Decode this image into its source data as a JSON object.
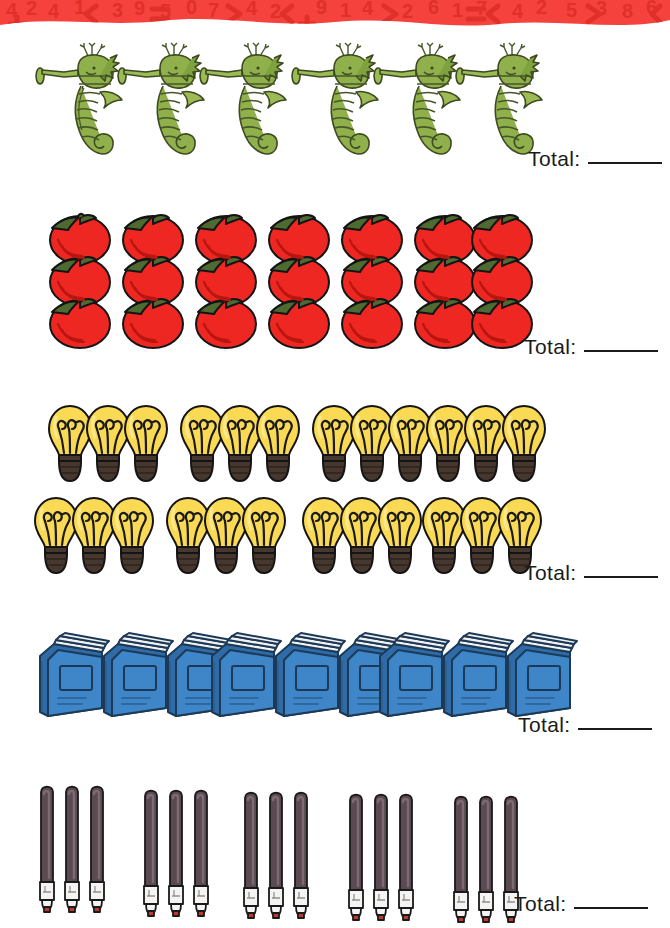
{
  "worksheet": {
    "banner": {
      "name": "decorative-number-border",
      "base_color": "#f5423c",
      "pattern_color": "#e8322c",
      "symbols": [
        "4",
        "2",
        "<",
        ">",
        "9",
        "+",
        "1",
        "7",
        "<",
        ">",
        "3",
        "6",
        "=",
        "7",
        "2",
        "4",
        "<",
        "5"
      ]
    },
    "total_label": "Total:",
    "rows": [
      {
        "id": "row-seahorses",
        "item": "seahorse",
        "item_label": "seahorse",
        "groups": 2,
        "per_group": 3,
        "count": 6,
        "arrangement": "1 line of 2 groups",
        "colors": {
          "body": "#8fb04a",
          "dark": "#47562a",
          "outline": "#3d4a22"
        },
        "total_value": ""
      },
      {
        "id": "row-tomatoes",
        "item": "tomato",
        "item_label": "tomato",
        "groups": 7,
        "per_group": 3,
        "count": 21,
        "arrangement": "7 vertical stacks of 3",
        "colors": {
          "body": "#ee2722",
          "dark": "#b8160f",
          "stem": "#4d6b31",
          "outline": "#1a1a1a"
        },
        "total_value": ""
      },
      {
        "id": "row-lightbulbs",
        "item": "lightbulb",
        "item_label": "light bulb",
        "groups": 8,
        "per_group": 3,
        "count": 24,
        "arrangement": "2 lines of 4 groups",
        "colors": {
          "glass": "#fada54",
          "glass_light": "#fde88a",
          "base": "#46372f",
          "outline": "#1a1a1a"
        },
        "total_value": ""
      },
      {
        "id": "row-books",
        "item": "book",
        "item_label": "book",
        "groups": 3,
        "per_group": 3,
        "count": 9,
        "arrangement": "1 line of 3 groups",
        "colors": {
          "cover": "#3f86c8",
          "cover_dark": "#2f6ba6",
          "pages": "#f2f2f2",
          "outline": "#1c3a57"
        },
        "total_value": ""
      },
      {
        "id": "row-markers",
        "item": "marker",
        "item_label": "marker",
        "groups": 5,
        "per_group": 3,
        "count": 15,
        "arrangement": "1 line of 5 groups",
        "colors": {
          "barrel": "#5b4a52",
          "barrel_dark": "#3b2f36",
          "collar": "#f6f4f2",
          "tip": "#c0392b",
          "outline": "#1a1a1a"
        },
        "total_value": ""
      }
    ]
  }
}
